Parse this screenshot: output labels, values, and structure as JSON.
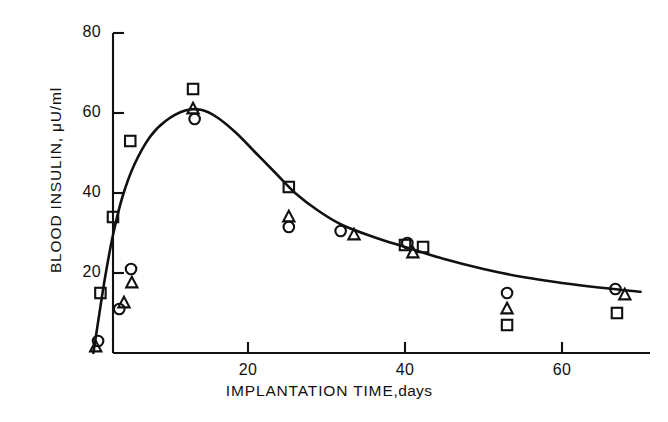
{
  "figure": {
    "background": "#ffffff",
    "ink_color": "#111111"
  },
  "chart_data": {
    "type": "scatter",
    "title": "",
    "xlabel_main": "IMPLANTATION  TIME",
    "xlabel_units": ",days",
    "xlabel": "IMPLANTATION TIME, days",
    "ylabel": "BLOOD INSULIN,  μU/ml",
    "xlim": [
      0,
      70
    ],
    "ylim": [
      0,
      80
    ],
    "xticks": [
      20,
      40,
      60
    ],
    "xticklabels": [
      "20",
      "40",
      "60"
    ],
    "yticks": [
      20,
      40,
      60,
      80
    ],
    "yticklabels": [
      "20",
      "40",
      "60",
      "80"
    ],
    "grid": false,
    "legend": "none",
    "series": [
      {
        "name": "square-series",
        "marker": "square",
        "points": [
          {
            "x": 1.2,
            "y": 15.0
          },
          {
            "x": 2.8,
            "y": 34.0
          },
          {
            "x": 5.0,
            "y": 53.0
          },
          {
            "x": 13.0,
            "y": 66.0
          },
          {
            "x": 25.2,
            "y": 41.5
          },
          {
            "x": 40.0,
            "y": 27.0
          },
          {
            "x": 42.3,
            "y": 26.5
          },
          {
            "x": 53.0,
            "y": 7.0
          },
          {
            "x": 67.0,
            "y": 10.0
          }
        ]
      },
      {
        "name": "triangle-series",
        "marker": "triangle",
        "points": [
          {
            "x": 0.6,
            "y": 1.5
          },
          {
            "x": 4.2,
            "y": 12.5
          },
          {
            "x": 5.2,
            "y": 17.5
          },
          {
            "x": 13.0,
            "y": 61.0
          },
          {
            "x": 25.2,
            "y": 34.0
          },
          {
            "x": 33.5,
            "y": 29.5
          },
          {
            "x": 41.0,
            "y": 25.0
          },
          {
            "x": 53.0,
            "y": 11.0
          },
          {
            "x": 68.0,
            "y": 14.5
          }
        ]
      },
      {
        "name": "circle-series",
        "marker": "circle",
        "points": [
          {
            "x": 0.9,
            "y": 3.0
          },
          {
            "x": 3.6,
            "y": 11.0
          },
          {
            "x": 5.1,
            "y": 21.0
          },
          {
            "x": 13.2,
            "y": 58.5
          },
          {
            "x": 25.2,
            "y": 31.5
          },
          {
            "x": 31.8,
            "y": 30.5
          },
          {
            "x": 40.3,
            "y": 27.5
          },
          {
            "x": 53.0,
            "y": 15.0
          },
          {
            "x": 66.8,
            "y": 16.0
          }
        ]
      }
    ],
    "fit_curve": {
      "name": "fitted-trend-curve",
      "points": [
        {
          "x": 0.3,
          "y": 0.0
        },
        {
          "x": 1.0,
          "y": 9.0
        },
        {
          "x": 1.8,
          "y": 19.0
        },
        {
          "x": 2.8,
          "y": 29.5
        },
        {
          "x": 4.0,
          "y": 39.0
        },
        {
          "x": 5.5,
          "y": 47.0
        },
        {
          "x": 7.5,
          "y": 54.0
        },
        {
          "x": 9.5,
          "y": 58.0
        },
        {
          "x": 12.0,
          "y": 60.6
        },
        {
          "x": 14.0,
          "y": 60.8
        },
        {
          "x": 16.0,
          "y": 59.0
        },
        {
          "x": 18.5,
          "y": 55.0
        },
        {
          "x": 21.0,
          "y": 50.0
        },
        {
          "x": 23.5,
          "y": 45.0
        },
        {
          "x": 26.0,
          "y": 40.0
        },
        {
          "x": 29.0,
          "y": 35.5
        },
        {
          "x": 32.0,
          "y": 32.0
        },
        {
          "x": 36.0,
          "y": 29.0
        },
        {
          "x": 40.0,
          "y": 26.5
        },
        {
          "x": 45.0,
          "y": 23.5
        },
        {
          "x": 50.0,
          "y": 21.0
        },
        {
          "x": 55.0,
          "y": 19.0
        },
        {
          "x": 60.0,
          "y": 17.5
        },
        {
          "x": 65.0,
          "y": 16.3
        },
        {
          "x": 70.0,
          "y": 15.3
        }
      ]
    }
  }
}
